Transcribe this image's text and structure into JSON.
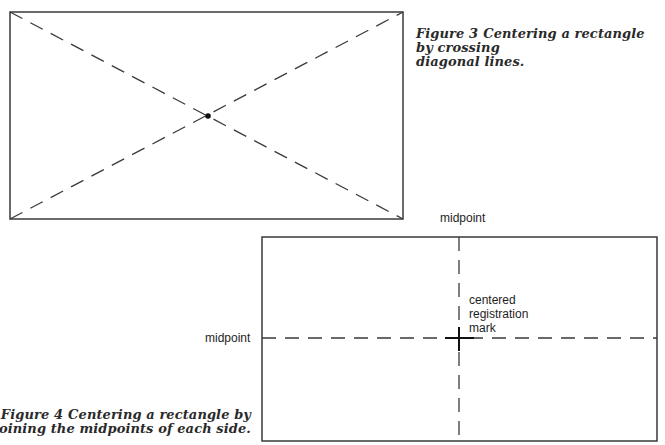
{
  "figure3": {
    "caption_number": "Figure 3",
    "caption_text": "Centering a rectangle by crossing",
    "caption_text_line2": "diagonal lines.",
    "rect": {
      "x": 10,
      "y": 12,
      "w": 393,
      "h": 207
    },
    "center_point": {
      "x": 208,
      "y": 116
    },
    "line_color": "#333333"
  },
  "figure4": {
    "caption_number": "Figure 4",
    "caption_text": "Centering a rectangle by",
    "caption_text_line2": "joining the midpoints of each side.",
    "labels": {
      "top_midpoint": "midpoint",
      "left_midpoint": "midpoint",
      "center_line1": "centered",
      "center_line2": "registration",
      "center_line3": "mark"
    },
    "rect": {
      "x": 262,
      "y": 237,
      "w": 395,
      "h": 204
    },
    "registration_mark": {
      "x": 459,
      "y": 338
    },
    "line_color": "#333333"
  }
}
